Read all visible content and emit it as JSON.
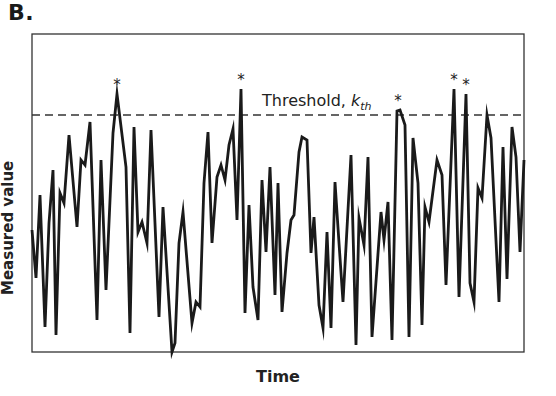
{
  "panel": {
    "label": "B."
  },
  "chart_data": {
    "type": "line",
    "title": "",
    "panel_label": "B.",
    "xlabel": "Time",
    "ylabel": "Measured value",
    "grid": false,
    "legend": null,
    "axis_ticks": "none",
    "threshold": {
      "label_text": "Threshold, ",
      "label_symbol": "k",
      "label_subscript": "th",
      "style": "dashed",
      "pixel_y": 115
    },
    "exceedance_marker": "*",
    "exceedances_pixel": [
      {
        "x": 117,
        "y": 94
      },
      {
        "x": 241,
        "y": 89
      },
      {
        "x": 398,
        "y": 110
      },
      {
        "x": 454,
        "y": 89
      },
      {
        "x": 466,
        "y": 94
      }
    ],
    "frame": {
      "left": 32,
      "top": 34,
      "right": 524,
      "bottom": 352
    },
    "series": [
      {
        "name": "Measured value",
        "color": "#1a1a1a",
        "points_pixel": [
          [
            32,
            230
          ],
          [
            36,
            278
          ],
          [
            40,
            195
          ],
          [
            45,
            327
          ],
          [
            49,
            223
          ],
          [
            53,
            170
          ],
          [
            56,
            335
          ],
          [
            60,
            193
          ],
          [
            64,
            203
          ],
          [
            69,
            135
          ],
          [
            77,
            227
          ],
          [
            81,
            160
          ],
          [
            85,
            165
          ],
          [
            90,
            122
          ],
          [
            97,
            320
          ],
          [
            101,
            160
          ],
          [
            106,
            290
          ],
          [
            113,
            133
          ],
          [
            117,
            94
          ],
          [
            126,
            167
          ],
          [
            130,
            333
          ],
          [
            134,
            127
          ],
          [
            138,
            232
          ],
          [
            142,
            222
          ],
          [
            147,
            243
          ],
          [
            151,
            130
          ],
          [
            159,
            317
          ],
          [
            163,
            207
          ],
          [
            172,
            352
          ],
          [
            175,
            343
          ],
          [
            179,
            243
          ],
          [
            183,
            212
          ],
          [
            192,
            323
          ],
          [
            196,
            302
          ],
          [
            200,
            307
          ],
          [
            204,
            183
          ],
          [
            208,
            132
          ],
          [
            212,
            243
          ],
          [
            217,
            177
          ],
          [
            221,
            165
          ],
          [
            225,
            180
          ],
          [
            229,
            145
          ],
          [
            233,
            129
          ],
          [
            237,
            220
          ],
          [
            241,
            89
          ],
          [
            245,
            313
          ],
          [
            249,
            205
          ],
          [
            253,
            287
          ],
          [
            258,
            320
          ],
          [
            262,
            180
          ],
          [
            266,
            252
          ],
          [
            270,
            167
          ],
          [
            275,
            295
          ],
          [
            278,
            183
          ],
          [
            282,
            312
          ],
          [
            287,
            253
          ],
          [
            291,
            220
          ],
          [
            294,
            215
          ],
          [
            299,
            152
          ],
          [
            302,
            137
          ],
          [
            307,
            140
          ],
          [
            311,
            253
          ],
          [
            314,
            217
          ],
          [
            319,
            305
          ],
          [
            323,
            328
          ],
          [
            327,
            232
          ],
          [
            331,
            328
          ],
          [
            335,
            182
          ],
          [
            339,
            243
          ],
          [
            343,
            302
          ],
          [
            351,
            155
          ],
          [
            356,
            345
          ],
          [
            359,
            218
          ],
          [
            364,
            245
          ],
          [
            368,
            157
          ],
          [
            372,
            337
          ],
          [
            381,
            212
          ],
          [
            384,
            240
          ],
          [
            388,
            202
          ],
          [
            392,
            340
          ],
          [
            397,
            111
          ],
          [
            400,
            110
          ],
          [
            405,
            125
          ],
          [
            409,
            337
          ],
          [
            413,
            138
          ],
          [
            418,
            183
          ],
          [
            422,
            325
          ],
          [
            425,
            207
          ],
          [
            429,
            222
          ],
          [
            437,
            160
          ],
          [
            442,
            175
          ],
          [
            446,
            285
          ],
          [
            454,
            89
          ],
          [
            459,
            297
          ],
          [
            466,
            94
          ],
          [
            470,
            283
          ],
          [
            474,
            302
          ],
          [
            478,
            188
          ],
          [
            482,
            198
          ],
          [
            487,
            115
          ],
          [
            491,
            138
          ],
          [
            499,
            302
          ],
          [
            503,
            147
          ],
          [
            507,
            279
          ],
          [
            512,
            127
          ],
          [
            516,
            157
          ],
          [
            520,
            252
          ],
          [
            524,
            160
          ]
        ]
      }
    ]
  }
}
